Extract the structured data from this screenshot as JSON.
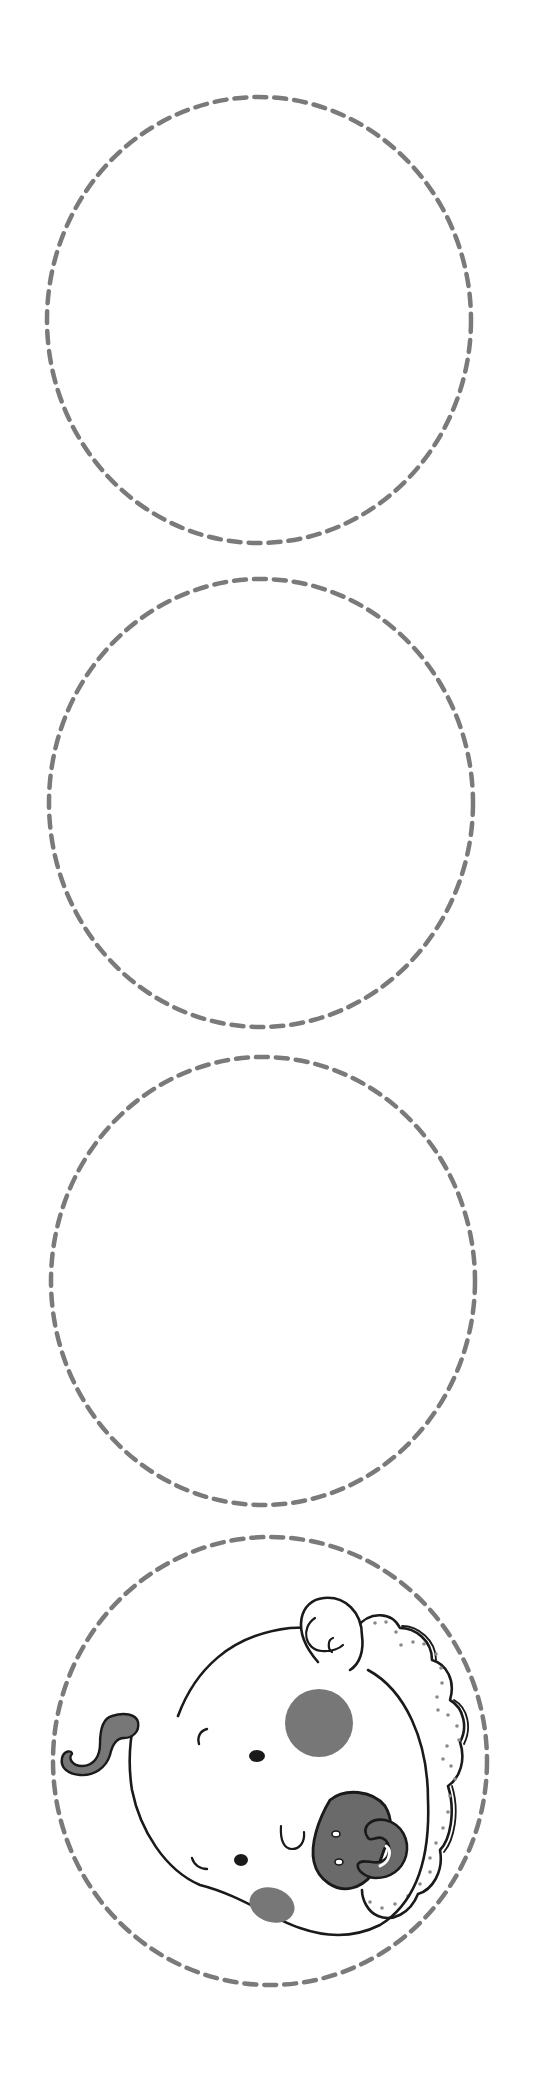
{
  "page": {
    "title": "Baby face cut-out circles",
    "background": "#ffffff"
  },
  "style": {
    "dash_color": "#7a7a7a",
    "ink_color": "#1a1a1a",
    "fill_gray": "#777777",
    "fill_gray_dark": "#6a6a6a",
    "dot_color": "#8a8a8a"
  },
  "circles": [
    {
      "label": "Blank cut-out circle 1",
      "cx": 259,
      "cy": 320,
      "rx": 212,
      "ry": 223,
      "content": "empty"
    },
    {
      "label": "Blank cut-out circle 2",
      "cx": 261,
      "cy": 803,
      "rx": 212,
      "ry": 224,
      "content": "empty"
    },
    {
      "label": "Blank cut-out circle 3",
      "cx": 263,
      "cy": 1281,
      "rx": 212,
      "ry": 224,
      "content": "empty"
    },
    {
      "label": "Baby face cut-out circle 4",
      "cx": 270,
      "cy": 1761,
      "rx": 217,
      "ry": 224,
      "content": "baby-face-with-pacifier"
    }
  ],
  "illustration": {
    "subject": "sleeping baby with pacifier and frilled bonnet",
    "orientation": "rotated sideways, head top facing left",
    "features": [
      "hair-curl",
      "ear",
      "frilled-bonnet",
      "cheek-spot-large",
      "cheek-spot-small",
      "closed-eye",
      "eyebrows",
      "eye-dots",
      "pacifier"
    ]
  }
}
